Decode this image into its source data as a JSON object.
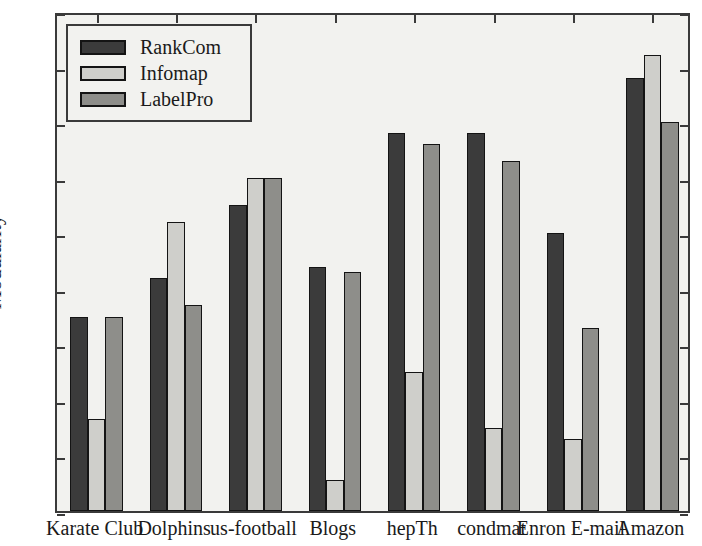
{
  "chart_data": {
    "type": "bar",
    "title": "",
    "xlabel": "",
    "ylabel": "Modularity",
    "ylim": [
      0.0,
      0.9
    ],
    "ytick_labels": [
      "0.0",
      "0.1",
      "0.2",
      "0.3",
      "0.4",
      "0.5",
      "0.6",
      "0.7",
      "0.8",
      "0.9"
    ],
    "ytick_values": [
      0.0,
      0.1,
      0.2,
      0.3,
      0.4,
      0.5,
      0.6,
      0.7,
      0.8,
      0.9
    ],
    "grid": false,
    "legend_position": "upper left",
    "categories": [
      "Karate Club",
      "Dolphins",
      "us-football",
      "Blogs",
      "hepTh",
      "condmat",
      "Enron E-mail",
      "Amazon"
    ],
    "series": [
      {
        "name": "RankCom",
        "color": "#3b3b3b",
        "values": [
          0.35,
          0.42,
          0.55,
          0.44,
          0.68,
          0.68,
          0.5,
          0.78
        ]
      },
      {
        "name": "Infomap",
        "color": "#cfcfcb",
        "values": [
          0.165,
          0.52,
          0.6,
          0.055,
          0.25,
          0.15,
          0.13,
          0.82
        ]
      },
      {
        "name": "LabelPro",
        "color": "#8e8e8a",
        "values": [
          0.35,
          0.37,
          0.6,
          0.43,
          0.66,
          0.63,
          0.33,
          0.7
        ]
      }
    ]
  }
}
